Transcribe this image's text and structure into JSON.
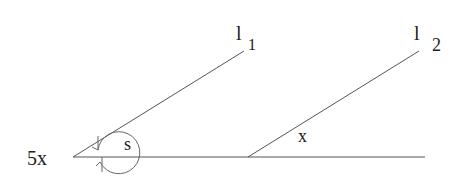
{
  "diagram": {
    "labels": {
      "l1_main": "l",
      "l1_sub": "1",
      "l2_main": "l",
      "l2_sub": "2",
      "s": "s",
      "x": "x",
      "moment": "5x"
    },
    "colors": {
      "line": "#555555",
      "text": "#222222"
    }
  }
}
